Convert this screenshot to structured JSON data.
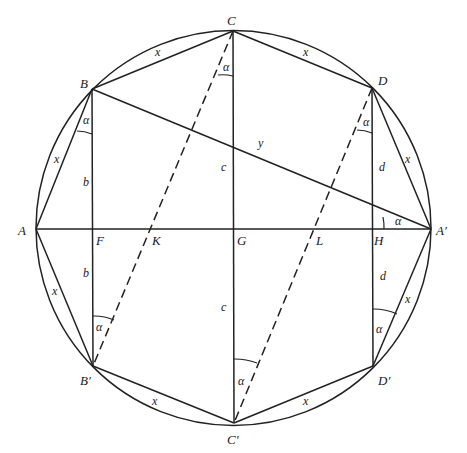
{
  "figure": {
    "type": "geometry-diagram",
    "circle": {
      "cx": 233.5,
      "cy": 228,
      "r": 197.5
    },
    "points": {
      "A": {
        "label": "A",
        "x": 36,
        "y": 229,
        "lx": 18,
        "ly": 235
      },
      "A_prime": {
        "label": "A′",
        "x": 431,
        "y": 229,
        "lx": 436,
        "ly": 235
      },
      "B": {
        "label": "B",
        "x": 92,
        "y": 89,
        "lx": 80,
        "ly": 88
      },
      "B_prime": {
        "label": "B′",
        "x": 93,
        "y": 366,
        "lx": 80,
        "ly": 385
      },
      "C": {
        "label": "C",
        "x": 233,
        "y": 31,
        "lx": 227,
        "ly": 25
      },
      "C_prime": {
        "label": "C′",
        "x": 234,
        "y": 423,
        "lx": 227,
        "ly": 444
      },
      "D": {
        "label": "D",
        "x": 372,
        "y": 88,
        "lx": 378,
        "ly": 85
      },
      "D_prime": {
        "label": "D′",
        "x": 373,
        "y": 366,
        "lx": 378,
        "ly": 385
      },
      "F": {
        "label": "F",
        "x": 93,
        "y": 229,
        "lx": 96,
        "ly": 245
      },
      "K": {
        "label": "K",
        "x": 150,
        "y": 229,
        "lx": 152,
        "ly": 245
      },
      "G": {
        "label": "G",
        "x": 234,
        "y": 229,
        "lx": 237,
        "ly": 245
      },
      "L": {
        "label": "L",
        "x": 315,
        "y": 229,
        "lx": 316,
        "ly": 245
      },
      "H": {
        "label": "H",
        "x": 373,
        "y": 229,
        "lx": 374,
        "ly": 245
      }
    },
    "solid_segments": [
      [
        "A",
        "B"
      ],
      [
        "B",
        "C"
      ],
      [
        "C",
        "D"
      ],
      [
        "D",
        "A_prime"
      ],
      [
        "A",
        "B_prime"
      ],
      [
        "B_prime",
        "C_prime"
      ],
      [
        "C_prime",
        "D_prime"
      ],
      [
        "D_prime",
        "A_prime"
      ],
      [
        "A",
        "A_prime"
      ],
      [
        "B",
        "B_prime"
      ],
      [
        "C",
        "C_prime"
      ],
      [
        "D",
        "D_prime"
      ],
      [
        "B",
        "A_prime"
      ]
    ],
    "dashed_segments": [
      [
        "C",
        "B_prime"
      ],
      [
        "D",
        "C_prime"
      ]
    ],
    "segment_labels": [
      {
        "text": "x",
        "x": 155,
        "y": 56
      },
      {
        "text": "x",
        "x": 303,
        "y": 56
      },
      {
        "text": "x",
        "x": 54,
        "y": 163
      },
      {
        "text": "x",
        "x": 405,
        "y": 163
      },
      {
        "text": "x",
        "x": 52,
        "y": 295
      },
      {
        "text": "x",
        "x": 405,
        "y": 303
      },
      {
        "text": "x",
        "x": 152,
        "y": 405
      },
      {
        "text": "x",
        "x": 303,
        "y": 405
      },
      {
        "text": "y",
        "x": 258,
        "y": 147
      },
      {
        "text": "b",
        "x": 83,
        "y": 186
      },
      {
        "text": "b",
        "x": 83,
        "y": 277
      },
      {
        "text": "c",
        "x": 221,
        "y": 171
      },
      {
        "text": "c",
        "x": 221,
        "y": 311
      },
      {
        "text": "d",
        "x": 379,
        "y": 171
      },
      {
        "text": "d",
        "x": 380,
        "y": 280
      }
    ],
    "angle_arcs": [
      {
        "vertex": "B",
        "d": "M77,131 A44,44 0 0 1 92,134"
      },
      {
        "vertex": "C",
        "d": "M218,75 A45,45 0 0 1 233,76"
      },
      {
        "vertex": "D",
        "d": "M357,130 A44,44 0 0 1 372,133"
      },
      {
        "vertex": "A_prime",
        "d": "M383,217 A48,48 0 0 1 384,229"
      },
      {
        "vertex": "B_prime",
        "d": "M93,316 A50,50 0 0 1 114,320"
      },
      {
        "vertex": "C_prime",
        "d": "M234,359 A64,64 0 0 1 257,363"
      },
      {
        "vertex": "D_prime",
        "d": "M373,309 A57,57 0 0 1 397,314"
      }
    ],
    "angle_labels": [
      {
        "text": "α",
        "x": 83,
        "y": 124
      },
      {
        "text": "α",
        "x": 223,
        "y": 71
      },
      {
        "text": "α",
        "x": 363,
        "y": 126
      },
      {
        "text": "α",
        "x": 395,
        "y": 225
      },
      {
        "text": "α",
        "x": 96,
        "y": 331
      },
      {
        "text": "α",
        "x": 238,
        "y": 385
      },
      {
        "text": "α",
        "x": 376,
        "y": 333
      }
    ]
  }
}
